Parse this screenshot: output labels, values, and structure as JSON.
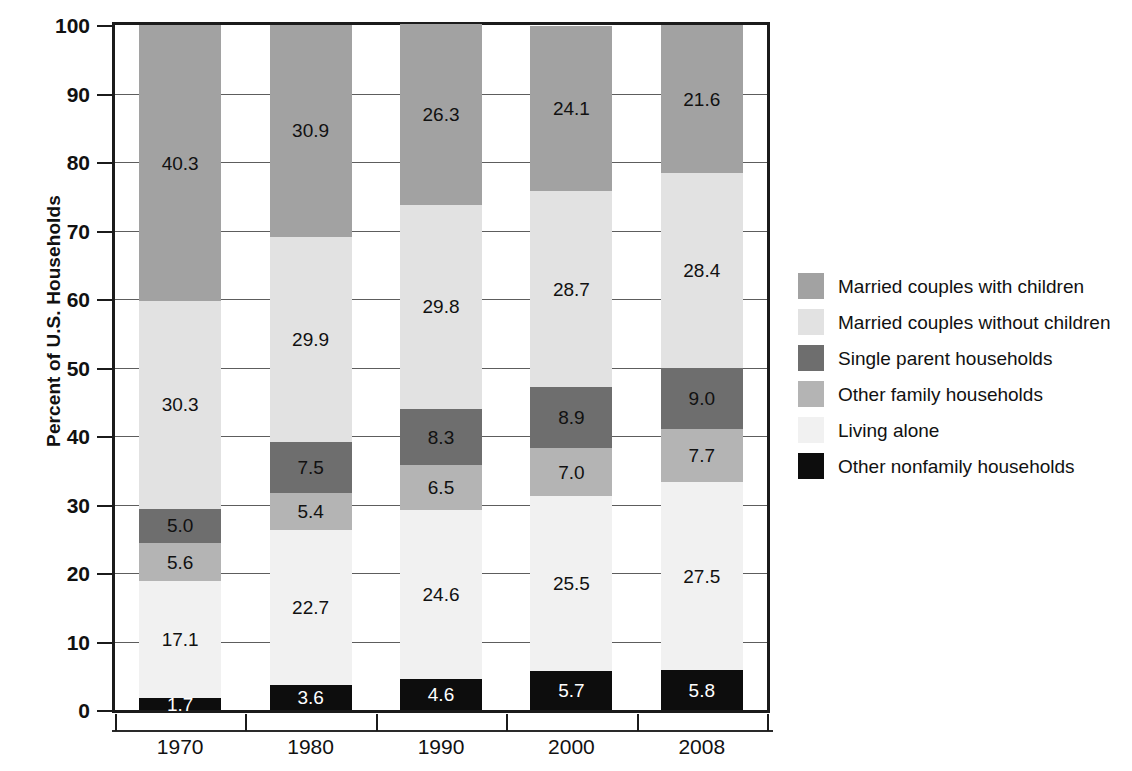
{
  "chart_data": {
    "type": "bar",
    "subtype": "stacked-bar-100",
    "title": "",
    "xlabel": "",
    "ylabel": "Percent of U.S. Households",
    "ylim": [
      0,
      100
    ],
    "ytick_step": 10,
    "ytick_labels": [
      "100",
      "90",
      "80",
      "70",
      "60",
      "50",
      "40",
      "30",
      "20",
      "10",
      "0"
    ],
    "ytick_values": [
      100,
      90,
      80,
      70,
      60,
      50,
      40,
      30,
      20,
      10,
      0
    ],
    "grid": true,
    "grid_axis": "y",
    "legend_position": "right",
    "categories": [
      "1970",
      "1980",
      "1990",
      "2000",
      "2008"
    ],
    "stack_order_bottom_to_top": [
      "Other nonfamily households",
      "Living alone",
      "Other family households",
      "Single parent households",
      "Married couples without children",
      "Married couples with children"
    ],
    "series": [
      {
        "name": "Married couples with children",
        "color": "#a2a2a2",
        "label_color": "#111111",
        "values": [
          40.3,
          30.9,
          26.3,
          24.1,
          21.6
        ],
        "value_labels": [
          "40.3",
          "30.9",
          "26.3",
          "24.1",
          "21.6"
        ]
      },
      {
        "name": "Married couples without children",
        "color": "#e2e2e2",
        "label_color": "#111111",
        "values": [
          30.3,
          29.9,
          29.8,
          28.7,
          28.4
        ],
        "value_labels": [
          "30.3",
          "29.9",
          "29.8",
          "28.7",
          "28.4"
        ]
      },
      {
        "name": "Single parent households",
        "color": "#6e6e6e",
        "label_color": "#111111",
        "values": [
          5.0,
          7.5,
          8.3,
          8.9,
          9.0
        ],
        "value_labels": [
          "5.0",
          "7.5",
          "8.3",
          "8.9",
          "9.0"
        ]
      },
      {
        "name": "Other family households",
        "color": "#b4b4b4",
        "label_color": "#111111",
        "values": [
          5.6,
          5.4,
          6.5,
          7.0,
          7.7
        ],
        "value_labels": [
          "5.6",
          "5.4",
          "6.5",
          "7.0",
          "7.7"
        ]
      },
      {
        "name": "Living alone",
        "color": "#f1f1f1",
        "label_color": "#111111",
        "values": [
          17.1,
          22.7,
          24.6,
          25.5,
          27.5
        ],
        "value_labels": [
          "17.1",
          "22.7",
          "24.6",
          "25.5",
          "27.5"
        ]
      },
      {
        "name": "Other nonfamily households",
        "color": "#0d0d0d",
        "label_color": "#ffffff",
        "values": [
          1.7,
          3.6,
          4.6,
          5.7,
          5.8
        ],
        "value_labels": [
          "1.7",
          "3.6",
          "4.6",
          "5.7",
          "5.8"
        ]
      }
    ],
    "column_totals": [
      100.0,
      100.0,
      100.1,
      99.9,
      100.0
    ]
  },
  "legend": {
    "items": [
      {
        "label": "Married couples with children",
        "color": "#a2a2a2"
      },
      {
        "label": "Married couples without children",
        "color": "#e2e2e2"
      },
      {
        "label": "Single parent households",
        "color": "#6e6e6e"
      },
      {
        "label": "Other family households",
        "color": "#b4b4b4"
      },
      {
        "label": "Living alone",
        "color": "#f1f1f1"
      },
      {
        "label": "Other nonfamily households",
        "color": "#0d0d0d"
      }
    ]
  }
}
